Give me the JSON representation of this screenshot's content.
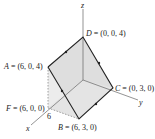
{
  "diagram": {
    "axes": {
      "x": "x",
      "y": "y",
      "z": "z",
      "x_tick": "6"
    },
    "points": {
      "D": {
        "name": "D",
        "coords": " = (0, 0, 4)"
      },
      "A": {
        "name": "A",
        "coords": " = (6, 0, 4)"
      },
      "C": {
        "name": "C",
        "coords": " = (0, 3, 0)"
      },
      "F": {
        "name": "F",
        "coords": " = (6, 0, 0)"
      },
      "B": {
        "name": "B",
        "coords": " = (6, 3, 0)"
      }
    },
    "colors": {
      "edge": "#222222",
      "face": "#d9d9d9",
      "face_light": "#ececec",
      "axis": "#555555"
    }
  }
}
